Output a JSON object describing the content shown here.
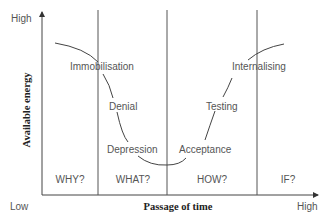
{
  "diagram": {
    "type": "change-curve",
    "y_axis": {
      "label": "Available energy",
      "high": "High"
    },
    "x_axis": {
      "label": "Passage of time",
      "low": "Low",
      "high": "High"
    },
    "stages": [
      "Immobilisation",
      "Denial",
      "Depression",
      "Acceptance",
      "Testing",
      "Internalising"
    ],
    "phases": [
      "WHY?",
      "WHAT?",
      "HOW?",
      "IF?"
    ],
    "colors": {
      "line": "#444444",
      "text": "#555555"
    }
  }
}
